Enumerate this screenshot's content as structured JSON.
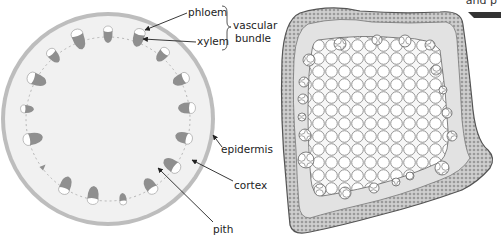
{
  "figure": {
    "type": "stem cross-section diagram",
    "left_panel": {
      "description": "schematic dicot stem cross-section",
      "labels": {
        "phloem": "phloem",
        "xylem": "xylem",
        "vascular_bundle_line1": "vascular",
        "vascular_bundle_line2": "bundle",
        "epidermis": "epidermis",
        "cortex": "cortex",
        "pith": "pith"
      },
      "colors": {
        "epidermis": "#bdbdbd",
        "ground": "#f1f1f1",
        "xylem": "#8f8f8f",
        "phloem": "#ffffff",
        "ring_dash": "#b5b5b5",
        "arrow": "#222222"
      }
    },
    "right_panel": {
      "description": "micrograph of stem cross-section showing vascular bundles in ring around pith"
    },
    "corner_text": "and p"
  }
}
